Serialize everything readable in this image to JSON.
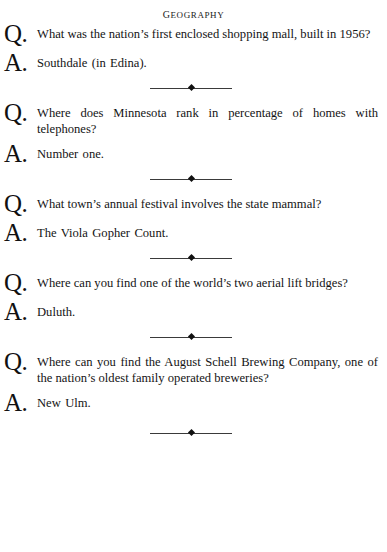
{
  "page": {
    "section_title": "Geography",
    "separator_icon": "diamond-rule-ornament"
  },
  "entries": [
    {
      "q_marker": "Q.",
      "question": "What was the nation’s first enclosed shopping mall, built in 1956?",
      "a_marker": "A.",
      "answer": "Southdale (in Edina)."
    },
    {
      "q_marker": "Q.",
      "question": "Where does Minnesota rank in percentage of homes with telephones?",
      "a_marker": "A.",
      "answer": "Number one."
    },
    {
      "q_marker": "Q.",
      "question": "What town’s annual festival involves the state mammal?",
      "a_marker": "A.",
      "answer": "The Viola Gopher Count."
    },
    {
      "q_marker": "Q.",
      "question": "Where can you find one of the world’s two aerial lift bridges?",
      "a_marker": "A.",
      "answer": "Duluth."
    },
    {
      "q_marker": "Q.",
      "question": "Where can you find the August Schell Brewing Com­pany, one of the nation’s oldest family operated brew­eries?",
      "a_marker": "A.",
      "answer": "New Ulm."
    }
  ]
}
